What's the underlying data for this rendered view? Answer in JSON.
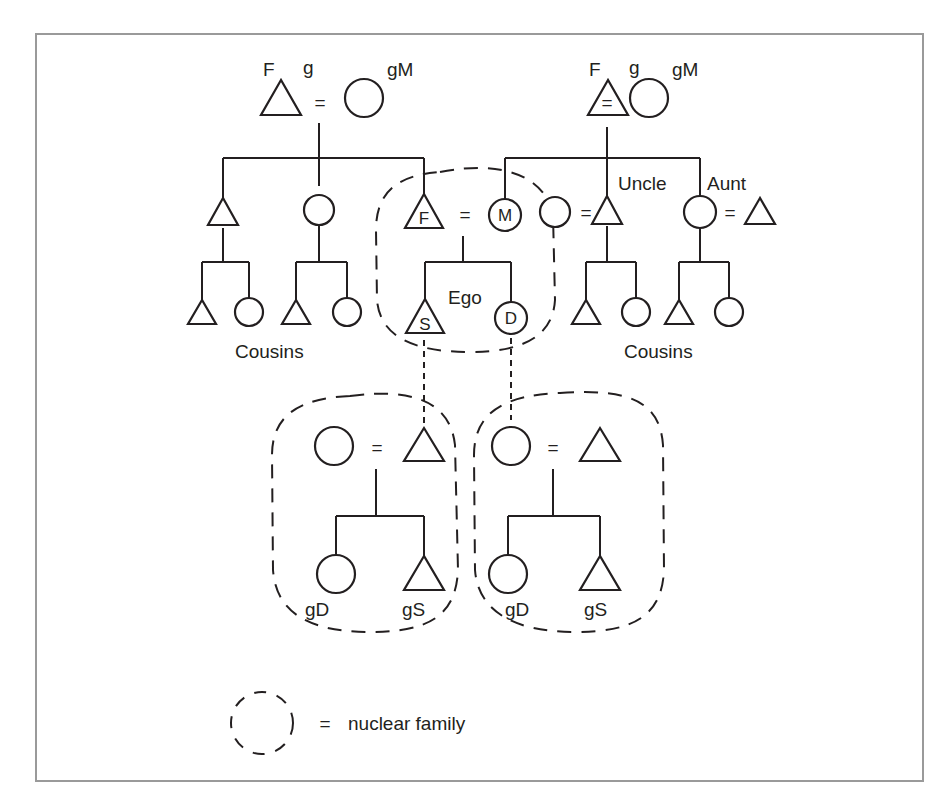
{
  "diagram": {
    "type": "kinship-chart",
    "colors": {
      "line": "#231f20",
      "frame": "#9a9a9a",
      "background": "#ffffff"
    },
    "symbols": {
      "male": "triangle",
      "female": "circle",
      "marriage": "="
    },
    "labels": {
      "left_grandfather": "F",
      "left_grandfather_prefix": "g",
      "left_grandmother": "gM",
      "right_grandfather": "F",
      "right_grandfather_prefix": "g",
      "right_grandmother": "gM",
      "equals": "=",
      "father": "F",
      "mother": "M",
      "son": "S",
      "daughter": "D",
      "ego": "Ego",
      "uncle": "Uncle",
      "aunt": "Aunt",
      "cousins_left": "Cousins",
      "cousins_right": "Cousins",
      "granddaughter": "gD",
      "grandson": "gS"
    },
    "legend": {
      "symbol": "dashed-circle",
      "equals": "=",
      "text": "nuclear family"
    },
    "families": [
      {
        "name": "paternal grandparents",
        "members": [
          "gF",
          "gM"
        ],
        "children": [
          "son",
          "daughter",
          "F"
        ]
      },
      {
        "name": "maternal grandparents",
        "members": [
          "gF",
          "gM"
        ],
        "children": [
          "M",
          "Uncle",
          "Aunt"
        ]
      },
      {
        "name": "ego nuclear family",
        "members": [
          "F",
          "M"
        ],
        "children": [
          "S",
          "D"
        ]
      },
      {
        "name": "son's nuclear family",
        "members": [
          "wife",
          "S"
        ],
        "children": [
          "gD",
          "gS"
        ]
      },
      {
        "name": "daughter's nuclear family",
        "members": [
          "D",
          "husband"
        ],
        "children": [
          "gD",
          "gS"
        ]
      }
    ]
  }
}
